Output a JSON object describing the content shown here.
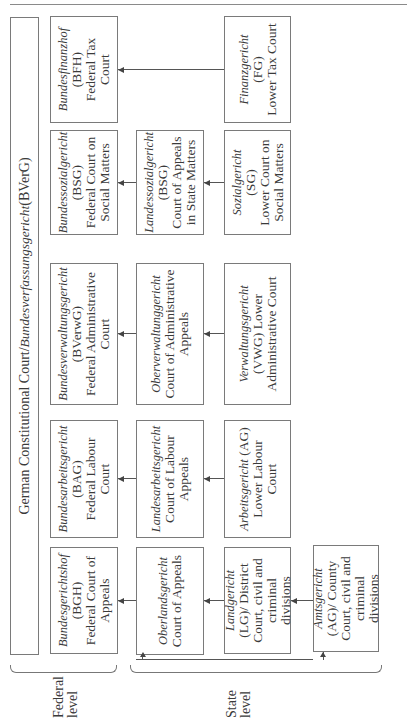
{
  "diagram": {
    "constitutional_court": {
      "label_en": "German Constitutional Court/",
      "label_de": "Bundesverfassungsgericht",
      "abbr": " (BVerG)"
    },
    "federal_courts": [
      {
        "de": "Bundesgerichtshof",
        "abbr": "(BGH)",
        "en": "Federal Court of Appeals"
      },
      {
        "de": "Bundesarbeitsgericht",
        "abbr": "(BAG)",
        "en": "Federal Labour Court"
      },
      {
        "de": "Bundesverwaltungsgericht",
        "abbr": "(BVerwG)",
        "en": "Federal Administrative Court"
      },
      {
        "de": "Bundessozialgericht",
        "abbr": "(BSG)",
        "en": "Federal Court on Social Matters"
      },
      {
        "de": "Bundesfinanzhof",
        "abbr": "(BFH)",
        "en": "Federal Tax Court"
      }
    ],
    "state_appeal_courts": [
      {
        "de": "Oberlandsgericht",
        "en": "Court of Appeals"
      },
      {
        "de": "Landesarbeitsgericht",
        "en": "Court of Labour Appeals"
      },
      {
        "de": "Oberverwaltunggericht",
        "en": "Court of Administrative Appeals"
      },
      {
        "de": "Landessozialgericht",
        "abbr": "(BSG)",
        "en": "Court of Appeals in State Matters"
      }
    ],
    "state_lower_courts": [
      {
        "de": "Landgericht",
        "en": "(LG)/ District Court, civil and criminal divisions"
      },
      {
        "de": "Arbeitsgericht",
        "abbr": " (AG)",
        "en": "Lower Labour Court"
      },
      {
        "de": "Verwaltungsgericht",
        "en": "(VWG) Lower Administrative Court"
      },
      {
        "de": "Sozialgericht",
        "abbr": "(SG)",
        "en": "Lower Court on Social Matters"
      },
      {
        "de": "Finanzgericht",
        "abbr": "(FG)",
        "en": "Lower Tax Court"
      }
    ],
    "county_court": {
      "de": "Amtsgericht",
      "en": "(AG)/ County Court, civil and criminal divisions"
    },
    "levels": {
      "federal": "Federal level",
      "state": "State level"
    }
  }
}
